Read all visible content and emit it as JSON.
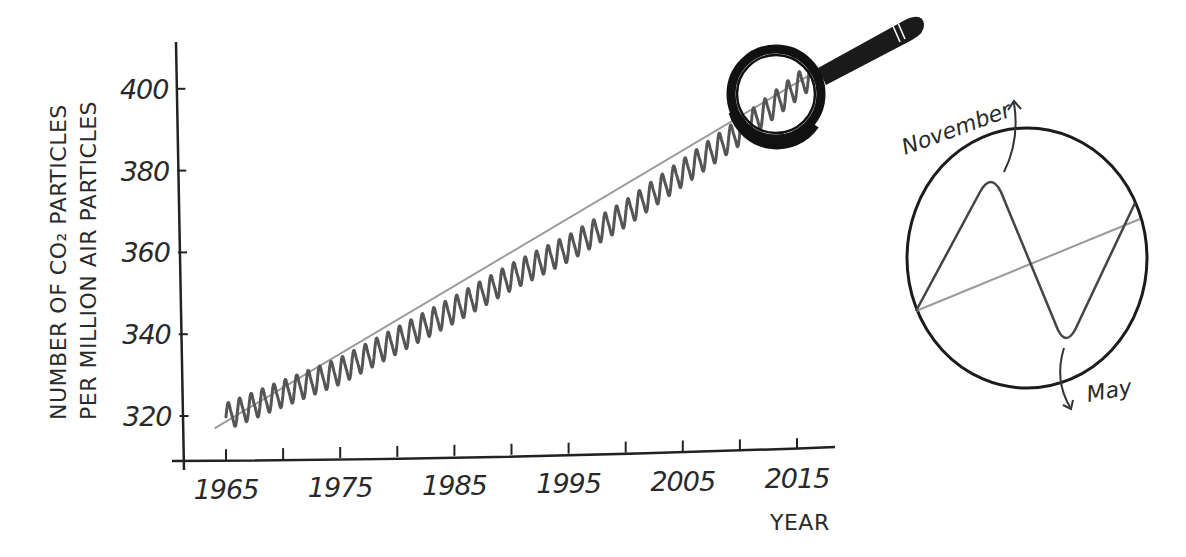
{
  "chart_data": {
    "type": "line",
    "title": "",
    "xlabel": "YEAR",
    "ylabel_lines": [
      "NUMBER OF CO₂ PARTICLES",
      "PER MILLION AIR PARTICLES"
    ],
    "xlim": [
      1963,
      2019
    ],
    "ylim": [
      309,
      412
    ],
    "x_ticks": [
      1965,
      1970,
      1975,
      1980,
      1985,
      1990,
      1995,
      2000,
      2005,
      2010,
      2015
    ],
    "x_tick_labels": [
      "1965",
      "1975",
      "1985",
      "1995",
      "2005",
      "2015"
    ],
    "y_ticks": [
      320,
      340,
      360,
      380,
      400
    ],
    "y_tick_labels": [
      "320",
      "340",
      "360",
      "380",
      "400"
    ],
    "grid": false,
    "legend": null,
    "series": [
      {
        "name": "Monthly CO2 (seasonal oscillation)",
        "style": "wavy",
        "color": "#555555",
        "seasonal_amplitude_ppm": 3,
        "start_year": 1965.0,
        "end_year": 2016.8,
        "trend_points": [
          [
            1965,
            319.8
          ],
          [
            1970,
            325.5
          ],
          [
            1975,
            331.0
          ],
          [
            1980,
            338.5
          ],
          [
            1985,
            346.0
          ],
          [
            1990,
            354.0
          ],
          [
            1995,
            361.0
          ],
          [
            2000,
            369.5
          ],
          [
            2005,
            379.5
          ],
          [
            2010,
            389.5
          ],
          [
            2015,
            400.5
          ],
          [
            2016.8,
            404.5
          ]
        ]
      },
      {
        "name": "Trend line",
        "style": "straight",
        "color": "#9a9a9a",
        "x": [
          1964.0,
          2016.8
        ],
        "y": [
          317.0,
          404.5
        ]
      }
    ],
    "annotations": [
      {
        "type": "magnifying-glass",
        "target_year_range": [
          2010,
          2016.5
        ],
        "description": "Magnifier over the last few years of the curve"
      },
      {
        "type": "inset-zoom-circle",
        "description": "Zoomed view of one annual cycle",
        "labels": {
          "peak": "November",
          "trough": "May"
        }
      }
    ]
  },
  "labels": {
    "x_axis_title": "YEAR",
    "y_axis_title_line1": "NUMBER OF CO₂ PARTICLES",
    "y_axis_title_line2": "PER MILLION AIR PARTICLES",
    "inset_peak_label": "November",
    "inset_trough_label": "May"
  },
  "colors": {
    "ink": "#222222",
    "curve": "#555555",
    "trend": "#9a9a9a",
    "background": "#ffffff"
  }
}
